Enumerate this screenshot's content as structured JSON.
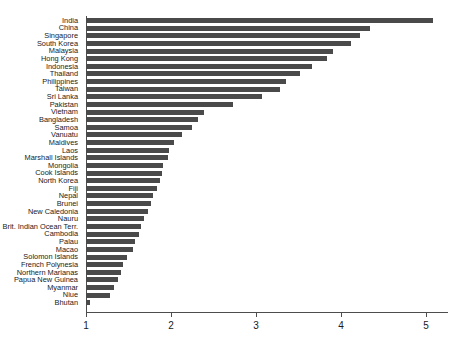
{
  "chart_data": {
    "type": "bar",
    "orientation": "horizontal",
    "title": "",
    "subtitle": "",
    "xlabel": "",
    "ylabel": "",
    "xlim": [
      1,
      5.3
    ],
    "ylim": null,
    "grid": false,
    "legend": null,
    "bar_color": "#4a4a4a",
    "axis_color": "#4d4d4d",
    "background": "#ffffff",
    "xticks": [
      1,
      2,
      3,
      4,
      5
    ],
    "xtick_labels": [
      "1",
      "2",
      "3",
      "4",
      "5"
    ],
    "categories": [
      "India",
      "China",
      "Singapore",
      "South Korea",
      "Malaysia",
      "Hong Kong",
      "Indonesia",
      "Thailand",
      "Philippines",
      "Taiwan",
      "Sri Lanka",
      "Pakistan",
      "Vietnam",
      "Bangladesh",
      "Samoa",
      "Vanuatu",
      "Maldives",
      "Laos",
      "Marshall Islands",
      "Mongolia",
      "Cook Islands",
      "North Korea",
      "Fiji",
      "Nepal",
      "Brunei",
      "New Caledonia",
      "Nauru",
      "Brit. Indian Ocean Terr.",
      "Cambodia",
      "Palau",
      "Macao",
      "Solomon Islands",
      "French Polynesia",
      "Northern Marianas",
      "Papua New Guinea",
      "Myanmar",
      "Niue",
      "Bhutan"
    ],
    "values": [
      5.08,
      4.34,
      4.22,
      4.12,
      3.91,
      3.84,
      3.66,
      3.52,
      3.35,
      3.28,
      3.07,
      2.73,
      2.39,
      2.32,
      2.25,
      2.13,
      2.03,
      1.98,
      1.96,
      1.91,
      1.89,
      1.87,
      1.83,
      1.79,
      1.76,
      1.73,
      1.68,
      1.65,
      1.62,
      1.58,
      1.55,
      1.48,
      1.44,
      1.41,
      1.38,
      1.33,
      1.28,
      1.05
    ]
  }
}
